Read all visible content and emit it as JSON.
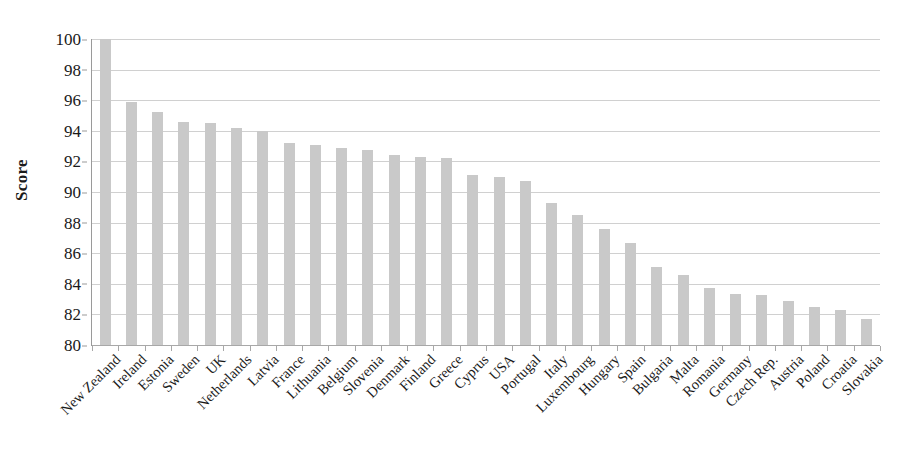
{
  "chart_data": {
    "type": "bar",
    "title": "",
    "xlabel": "",
    "ylabel": "Score",
    "ylim": [
      80,
      100
    ],
    "ytick_step": 2,
    "yticks": [
      100,
      98,
      96,
      94,
      92,
      90,
      88,
      86,
      84,
      82,
      80
    ],
    "grid": true,
    "legend": "none",
    "orientation": "vertical",
    "bar_color": "#c9c9c9",
    "gridline_color": "#d0d0d0",
    "axis_color": "#9a9a9a",
    "categories": [
      "New Zealand",
      "Ireland",
      "Estonia",
      "Sweden",
      "UK",
      "Netherlands",
      "Latvia",
      "France",
      "Lithuania",
      "Belgium",
      "Slovenia",
      "Denmark",
      "Finland",
      "Greece",
      "Cyprus",
      "USA",
      "Portugal",
      "Italy",
      "Luxembourg",
      "Hungary",
      "Spain",
      "Bulgaria",
      "Malta",
      "Romania",
      "Germany",
      "Czech Rep.",
      "Austria",
      "Poland",
      "Croatia",
      "Slovakia"
    ],
    "values": [
      100.0,
      95.9,
      95.2,
      94.6,
      94.5,
      94.2,
      94.0,
      93.2,
      93.1,
      92.9,
      92.75,
      92.4,
      92.3,
      92.25,
      91.1,
      91.0,
      90.7,
      89.3,
      88.5,
      87.6,
      86.7,
      85.1,
      84.6,
      83.7,
      83.35,
      83.3,
      82.9,
      82.5,
      82.3,
      81.7
    ]
  }
}
